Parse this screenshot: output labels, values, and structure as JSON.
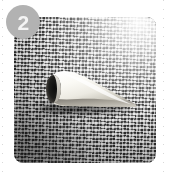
{
  "figure": {
    "step_badge": {
      "number": "2",
      "background_color": "#b2b2b2",
      "text_color": "#f4f4f4"
    },
    "photo": {
      "alt_description": "White cone-shaped object resting on a woven mat",
      "subject": "white cone",
      "background_surface": "woven textured mat",
      "corner_radius_px": "9",
      "dominant_colors": {
        "mat_mid": "#909090",
        "mat_highlight": "#f2f2f2",
        "mat_shadow": "#4a4a4a",
        "object_light": "#fbfaf6",
        "object_shadow": "#9a968c",
        "object_opening": "#151515"
      }
    },
    "guides": {
      "left_rule_color": "#b9b9b9",
      "right_rule_color": "#b9b9b9"
    },
    "page_background": "#ffffff"
  }
}
